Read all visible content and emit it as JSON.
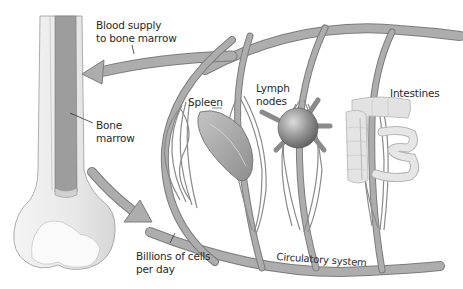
{
  "diagram": {
    "colors": {
      "vessel_fill": "#a9a9a9",
      "vessel_stroke": "#7c7c7c",
      "bone_fill": "#ececec",
      "bone_shadow": "#d4d4d4",
      "marrow_fill": "#9d9d9d",
      "organ_fill": "#b0b0b0",
      "intestine_fill": "#e0e0e0",
      "text": "#2a2a2a",
      "background": "#ffffff"
    },
    "labels": {
      "blood_supply_line1": "Blood supply",
      "blood_supply_line2": "to bone marrow",
      "bone_marrow_line1": "Bone",
      "bone_marrow_line2": "marrow",
      "spleen": "Spleen",
      "lymph_nodes_line1": "Lymph",
      "lymph_nodes_line2": "nodes",
      "intestines": "Intestines",
      "billions_line1": "Billions of cells",
      "billions_line2": "per day",
      "circulatory_system": "Circulatory system"
    },
    "nodes": [
      {
        "id": "bone",
        "label": "Bone (femur)"
      },
      {
        "id": "bone-marrow",
        "label": "Bone marrow"
      },
      {
        "id": "spleen",
        "label": "Spleen"
      },
      {
        "id": "lymph-nodes",
        "label": "Lymph nodes"
      },
      {
        "id": "intestines",
        "label": "Intestines"
      },
      {
        "id": "circulatory-system",
        "label": "Circulatory system"
      }
    ],
    "edges": [
      {
        "from": "circulatory-system",
        "to": "bone-marrow",
        "label": "Blood supply to bone marrow"
      },
      {
        "from": "bone-marrow",
        "to": "circulatory-system",
        "label": "Billions of cells per day"
      }
    ]
  }
}
